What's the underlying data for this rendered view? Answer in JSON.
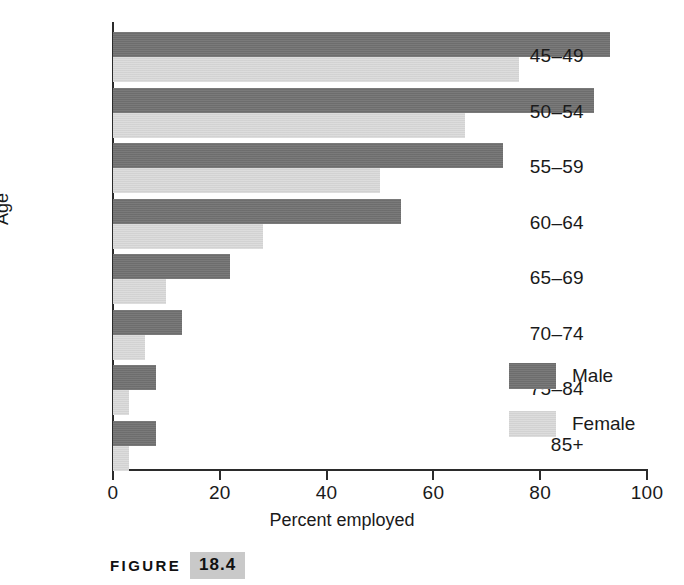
{
  "chart_data": {
    "type": "bar",
    "orientation": "horizontal",
    "title": "",
    "xlabel": "Percent employed",
    "ylabel": "Age",
    "xlim": [
      0,
      100
    ],
    "xticks": [
      0,
      20,
      40,
      60,
      80,
      100
    ],
    "xtick_labels": [
      "0",
      "20",
      "40",
      "60",
      "80",
      "100"
    ],
    "grid": false,
    "legend_position": "inside-right",
    "categories": [
      "45–49",
      "50–54",
      "55–59",
      "60–64",
      "65–69",
      "70–74",
      "75–84",
      "85+"
    ],
    "series": [
      {
        "name": "Male",
        "color": "#737373",
        "values": [
          93,
          90,
          73,
          54,
          22,
          13,
          8,
          8
        ]
      },
      {
        "name": "Female",
        "color": "#d9d9d9",
        "values": [
          76,
          66,
          50,
          28,
          10,
          6,
          3,
          3
        ]
      }
    ]
  },
  "caption": {
    "word": "FIGURE",
    "number": "18.4"
  }
}
